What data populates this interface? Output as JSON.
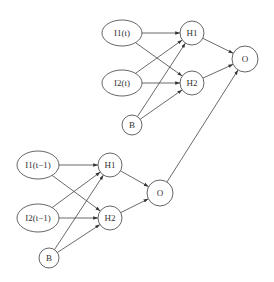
{
  "diagram": {
    "title": "",
    "colors": {
      "stroke": "#555555",
      "text": "#333333",
      "background": "#ffffff"
    },
    "nodes": [
      {
        "id": "t_I1",
        "label": "I1(t)",
        "shape": "ellipse",
        "cx": 122,
        "cy": 33,
        "rx": 20,
        "ry": 13
      },
      {
        "id": "t_I2",
        "label": "I2(t)",
        "shape": "ellipse",
        "cx": 122,
        "cy": 83,
        "rx": 20,
        "ry": 13
      },
      {
        "id": "t_B",
        "label": "B",
        "shape": "circle",
        "cx": 132,
        "cy": 125,
        "r": 10
      },
      {
        "id": "t_H1",
        "label": "H1",
        "shape": "circle",
        "cx": 192,
        "cy": 33,
        "r": 12
      },
      {
        "id": "t_H2",
        "label": "H2",
        "shape": "circle",
        "cx": 192,
        "cy": 83,
        "r": 12
      },
      {
        "id": "t_O",
        "label": "O",
        "shape": "circle",
        "cx": 245,
        "cy": 59,
        "r": 13
      },
      {
        "id": "p_I1",
        "label": "I1(t−1)",
        "shape": "ellipse",
        "cx": 38,
        "cy": 165,
        "rx": 21,
        "ry": 14
      },
      {
        "id": "p_I2",
        "label": "I2(t−1)",
        "shape": "ellipse",
        "cx": 38,
        "cy": 218,
        "rx": 21,
        "ry": 14
      },
      {
        "id": "p_B",
        "label": "B",
        "shape": "circle",
        "cx": 49,
        "cy": 258,
        "r": 10
      },
      {
        "id": "p_H1",
        "label": "H1",
        "shape": "circle",
        "cx": 110,
        "cy": 165,
        "r": 12
      },
      {
        "id": "p_H2",
        "label": "H2",
        "shape": "circle",
        "cx": 110,
        "cy": 218,
        "r": 12
      },
      {
        "id": "p_O",
        "label": "O",
        "shape": "circle",
        "cx": 160,
        "cy": 193,
        "r": 13
      }
    ],
    "edges": [
      [
        "t_I1",
        "t_H1"
      ],
      [
        "t_I1",
        "t_H2"
      ],
      [
        "t_I2",
        "t_H1"
      ],
      [
        "t_I2",
        "t_H2"
      ],
      [
        "t_B",
        "t_H1"
      ],
      [
        "t_B",
        "t_H2"
      ],
      [
        "t_H1",
        "t_O"
      ],
      [
        "t_H2",
        "t_O"
      ],
      [
        "p_I1",
        "p_H1"
      ],
      [
        "p_I1",
        "p_H2"
      ],
      [
        "p_I2",
        "p_H1"
      ],
      [
        "p_I2",
        "p_H2"
      ],
      [
        "p_B",
        "p_H1"
      ],
      [
        "p_B",
        "p_H2"
      ],
      [
        "p_H1",
        "p_O"
      ],
      [
        "p_H2",
        "p_O"
      ],
      [
        "p_O",
        "t_O"
      ]
    ]
  },
  "labels": {
    "t_I1": "I1(t)",
    "t_I2": "I2(t)",
    "t_B": "B",
    "t_H1": "H1",
    "t_H2": "H2",
    "t_O": "O",
    "p_I1": "I1(t−1)",
    "p_I2": "I2(t−1)",
    "p_B": "B",
    "p_H1": "H1",
    "p_H2": "H2",
    "p_O": "O"
  }
}
